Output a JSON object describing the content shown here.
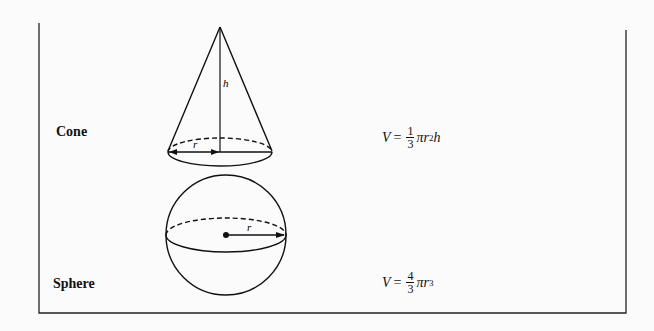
{
  "shapes": [
    {
      "name": "Cone",
      "formula": {
        "lhs": "V",
        "eq": "=",
        "num": "1",
        "den": "3",
        "pi": "π",
        "var": "r",
        "exp": "2",
        "tail": "h"
      },
      "labels": {
        "height": "h",
        "radius": "r"
      }
    },
    {
      "name": "Sphere",
      "formula": {
        "lhs": "V",
        "eq": "=",
        "num": "4",
        "den": "3",
        "pi": "π",
        "var": "r",
        "exp": "3",
        "tail": ""
      },
      "labels": {
        "radius": "r"
      }
    }
  ]
}
